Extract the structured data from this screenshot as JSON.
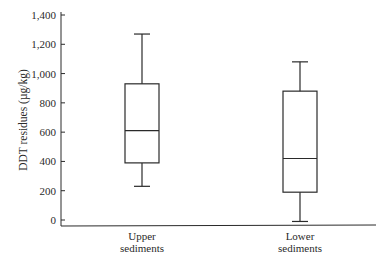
{
  "chart_data": {
    "type": "box",
    "title": "",
    "xlabel": "",
    "ylabel": "DDT residues (µg/kg)",
    "ylim": [
      0,
      1400
    ],
    "yticks": [
      0,
      200,
      400,
      600,
      800,
      1000,
      1200,
      1400
    ],
    "ytick_labels": [
      "0",
      "200",
      "400",
      "600",
      "800",
      "1,000",
      "1,200",
      "1,400"
    ],
    "grid": false,
    "legend": null,
    "categories": [
      "Upper sediments",
      "Lower sediments"
    ],
    "category_lines": [
      [
        "Upper",
        "sediments"
      ],
      [
        "Lower",
        "sediments"
      ]
    ],
    "series": [
      {
        "name": "Upper sediments",
        "whisker_low": 230,
        "q1": 390,
        "median": 610,
        "q3": 930,
        "whisker_high": 1270
      },
      {
        "name": "Lower sediments",
        "whisker_low": -10,
        "q1": 190,
        "median": 420,
        "q3": 880,
        "whisker_high": 1080
      }
    ]
  },
  "colors": {
    "stroke": "#2a2a2a",
    "background": "#ffffff"
  }
}
